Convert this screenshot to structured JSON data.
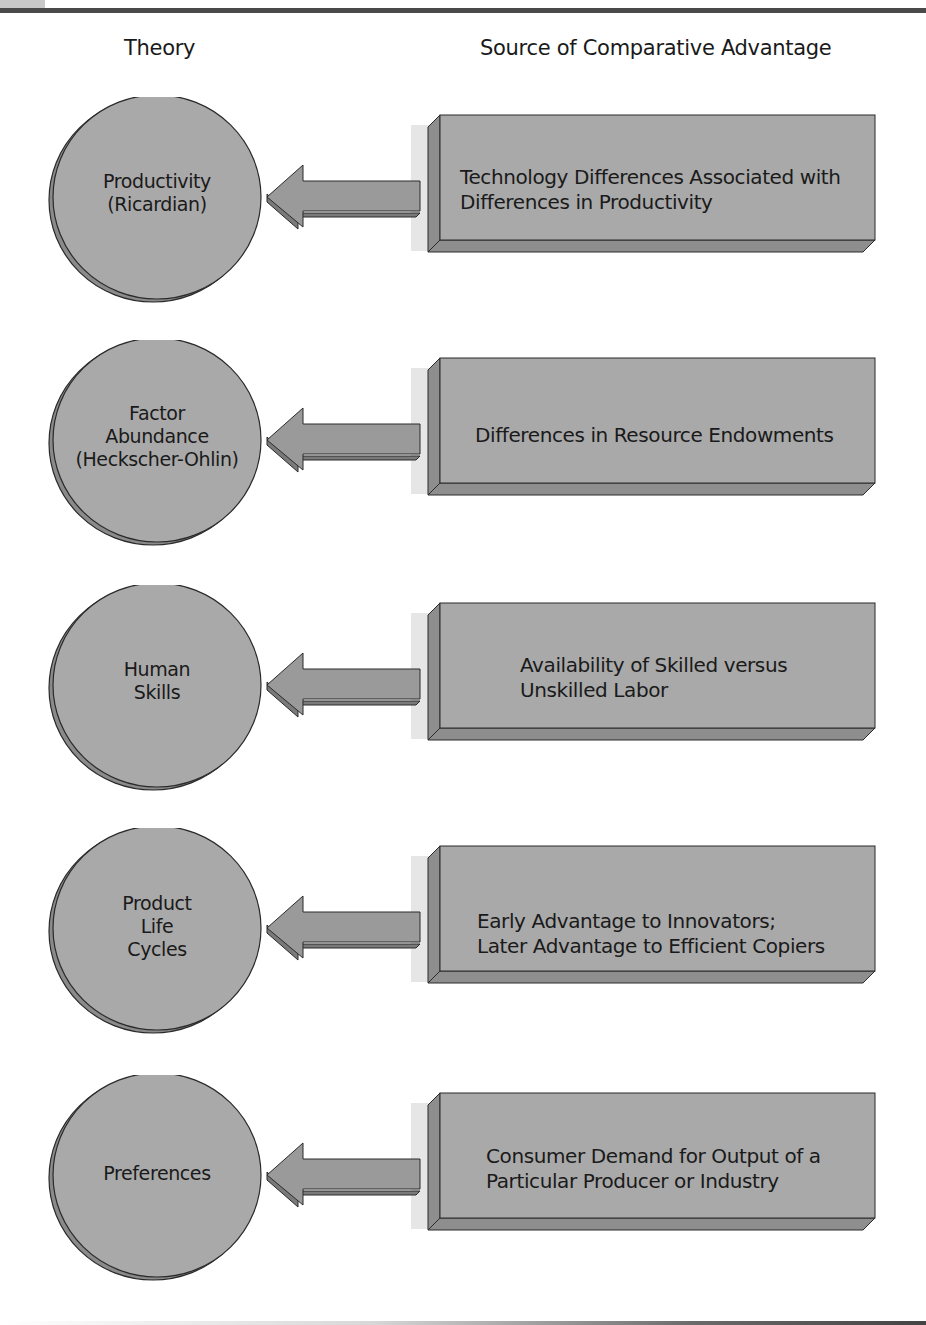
{
  "headers": {
    "theory": "Theory",
    "source": "Source of Comparative Advantage"
  },
  "colors": {
    "shape_fill": "#a9a9a9",
    "shape_bevel": "#8a8a8a",
    "outline": "#2a2a2a",
    "shadow": "#e6e6e6",
    "bar": "#4a4a4a"
  },
  "rows": [
    {
      "theory": [
        "Productivity",
        "(Ricardian)"
      ],
      "source": [
        "Technology Differences Associated with",
        "Differences in Productivity"
      ]
    },
    {
      "theory": [
        "Factor",
        "Abundance",
        "(Heckscher-Ohlin)"
      ],
      "source": [
        "Differences in Resource Endowments"
      ]
    },
    {
      "theory": [
        "Human",
        "Skills"
      ],
      "source": [
        "Availability of Skilled versus",
        "Unskilled Labor"
      ]
    },
    {
      "theory": [
        "Product",
        "Life",
        "Cycles"
      ],
      "source": [
        "Early Advantage to Innovators;",
        "Later Advantage to Efficient Copiers"
      ]
    },
    {
      "theory": [
        "Preferences"
      ],
      "source": [
        "Consumer Demand for Output of a",
        "Particular Producer or Industry"
      ]
    }
  ]
}
